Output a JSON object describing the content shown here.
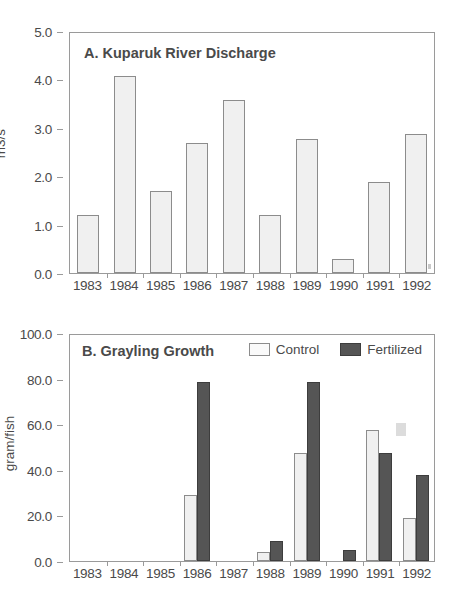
{
  "chart_data": [
    {
      "type": "bar",
      "panel": "A",
      "title": "A. Kuparuk River Discharge",
      "xlabel": "",
      "ylabel": "m3/s",
      "categories": [
        "1983",
        "1984",
        "1985",
        "1986",
        "1987",
        "1988",
        "1989",
        "1990",
        "1991",
        "1992"
      ],
      "values": [
        1.2,
        4.1,
        1.7,
        2.7,
        3.6,
        1.2,
        2.8,
        0.3,
        1.9,
        2.9
      ],
      "ylim": [
        0.0,
        5.0
      ],
      "yticks": [
        "0.0",
        "1.0",
        "2.0",
        "3.0",
        "4.0",
        "5.0"
      ],
      "ytick_values": [
        0.0,
        1.0,
        2.0,
        3.0,
        4.0,
        5.0
      ],
      "grid": false,
      "legend": null,
      "bar_color": "#f0f0f0"
    },
    {
      "type": "bar",
      "panel": "B",
      "title": "B. Grayling Growth",
      "xlabel": "",
      "ylabel": "gram/fish",
      "categories": [
        "1983",
        "1984",
        "1985",
        "1986",
        "1987",
        "1988",
        "1989",
        "1990",
        "1991",
        "1992"
      ],
      "series": [
        {
          "name": "Control",
          "values": [
            0,
            0,
            0,
            29,
            0,
            4,
            48,
            0,
            58,
            19
          ],
          "color": "#f0f0f0"
        },
        {
          "name": "Fertilized",
          "values": [
            0,
            0,
            0,
            79,
            0,
            9,
            79,
            5,
            48,
            38
          ],
          "color": "#555555"
        }
      ],
      "ylim": [
        0.0,
        100.0
      ],
      "yticks": [
        "0.0",
        "20.0",
        "40.0",
        "60.0",
        "80.0",
        "100.0"
      ],
      "ytick_values": [
        0.0,
        20.0,
        40.0,
        60.0,
        80.0,
        100.0
      ],
      "grid": false,
      "legend_position": "top-right"
    }
  ],
  "panel_a": {
    "title": "A. Kuparuk River Discharge",
    "ylabel": "m3/s",
    "yticks": [
      "5.0",
      "4.0",
      "3.0",
      "2.0",
      "1.0",
      "0.0"
    ],
    "xticks": [
      "1983",
      "1984",
      "1985",
      "1986",
      "1987",
      "1988",
      "1989",
      "1990",
      "1991",
      "1992"
    ]
  },
  "panel_b": {
    "title": "B. Grayling Growth",
    "ylabel": "gram/fish",
    "yticks": [
      "100.0",
      "80.0",
      "60.0",
      "40.0",
      "20.0",
      "0.0"
    ],
    "xticks": [
      "1983",
      "1984",
      "1985",
      "1986",
      "1987",
      "1988",
      "1989",
      "1990",
      "1991",
      "1992"
    ],
    "legend": {
      "control_label": "Control",
      "fertilized_label": "Fertilized"
    }
  },
  "colors": {
    "bar_light": "#f0f0f0",
    "bar_dark": "#555555",
    "axis": "#9a9a9a",
    "text": "#4a4a4a",
    "background": "#ffffff"
  }
}
